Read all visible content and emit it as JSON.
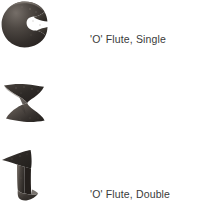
{
  "figure": {
    "background_color": "#ffffff",
    "text_color": "#3a3a3a",
    "shape_dark": "#2b2724",
    "shape_mid": "#4a443f",
    "shape_light": "#6e6761",
    "rows": [
      {
        "icon_name": "o-flute-single-profile",
        "label": "'O' Flute, Single"
      },
      {
        "icon_name": "o-flute-double-profile",
        "label": "'O' Flute, Double"
      },
      {
        "icon_name": "v-flute-double-profile",
        "label": "'V' Flute, Double"
      }
    ]
  }
}
